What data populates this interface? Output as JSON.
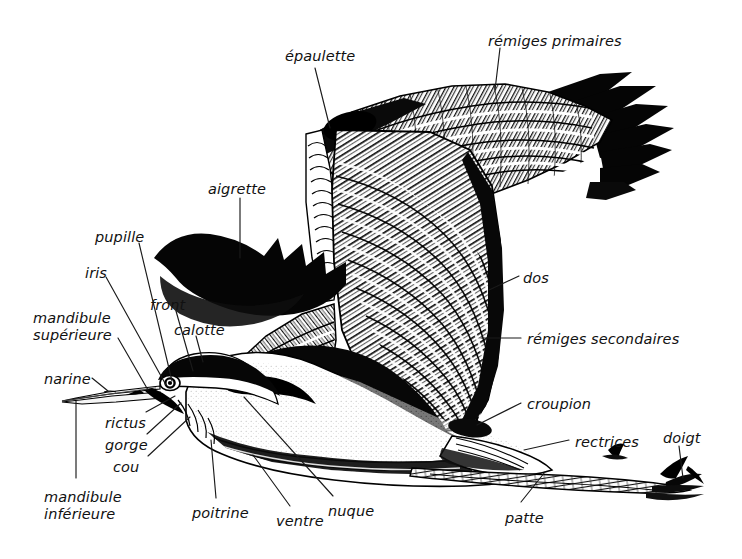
{
  "figure": {
    "style": "black-and-white pen-and-ink engraving",
    "background_color": "#ffffff",
    "ink_color": "#000000",
    "leader_line_color": "#1a1a1a"
  },
  "labels": [
    {
      "id": "epaulette",
      "text": "épaulette",
      "x": 285,
      "y": 48,
      "anchor": "start"
    },
    {
      "id": "remiges-primaires",
      "text": "rémiges primaires",
      "x": 488,
      "y": 33,
      "anchor": "start"
    },
    {
      "id": "aigrette",
      "text": "aigrette",
      "x": 208,
      "y": 181,
      "anchor": "start"
    },
    {
      "id": "pupille",
      "text": "pupille",
      "x": 95,
      "y": 229,
      "anchor": "start"
    },
    {
      "id": "iris",
      "text": "iris",
      "x": 85,
      "y": 265,
      "anchor": "start"
    },
    {
      "id": "mandibule-superieure",
      "text": "mandibule\nsupérieure",
      "x": 33,
      "y": 310,
      "anchor": "start"
    },
    {
      "id": "front",
      "text": "front",
      "x": 150,
      "y": 297,
      "anchor": "start"
    },
    {
      "id": "calotte",
      "text": "calotte",
      "x": 174,
      "y": 322,
      "anchor": "start"
    },
    {
      "id": "narine",
      "text": "narine",
      "x": 44,
      "y": 371,
      "anchor": "start"
    },
    {
      "id": "rictus",
      "text": "rictus",
      "x": 105,
      "y": 415,
      "anchor": "start"
    },
    {
      "id": "gorge",
      "text": "gorge",
      "x": 105,
      "y": 437,
      "anchor": "start"
    },
    {
      "id": "cou",
      "text": "cou",
      "x": 113,
      "y": 459,
      "anchor": "start"
    },
    {
      "id": "mandibule-inferieure",
      "text": "mandibule\ninférieure",
      "x": 44,
      "y": 489,
      "anchor": "start"
    },
    {
      "id": "poitrine",
      "text": "poitrine",
      "x": 192,
      "y": 505,
      "anchor": "start"
    },
    {
      "id": "ventre",
      "text": "ventre",
      "x": 276,
      "y": 513,
      "anchor": "start"
    },
    {
      "id": "nuque",
      "text": "nuque",
      "x": 328,
      "y": 503,
      "anchor": "start"
    },
    {
      "id": "dos",
      "text": "dos",
      "x": 523,
      "y": 270,
      "anchor": "start"
    },
    {
      "id": "remiges-secondaires",
      "text": "rémiges secondaires",
      "x": 527,
      "y": 331,
      "anchor": "start"
    },
    {
      "id": "croupion",
      "text": "croupion",
      "x": 527,
      "y": 396,
      "anchor": "start"
    },
    {
      "id": "rectrices",
      "text": "rectrices",
      "x": 575,
      "y": 434,
      "anchor": "start"
    },
    {
      "id": "patte",
      "text": "patte",
      "x": 505,
      "y": 510,
      "anchor": "start"
    },
    {
      "id": "doigt",
      "text": "doigt",
      "x": 663,
      "y": 430,
      "anchor": "start"
    }
  ],
  "leader_lines": [
    {
      "id": "leader-epaulette",
      "points": "315,68 330,128"
    },
    {
      "id": "leader-remiges-primaires",
      "points": "500,48 495,90"
    },
    {
      "id": "leader-aigrette",
      "points": "240,198 240,258"
    },
    {
      "id": "leader-pupille",
      "points": "139,243 172,381"
    },
    {
      "id": "leader-iris",
      "points": "106,277 166,385"
    },
    {
      "id": "leader-mandibule-superieure",
      "points": "118,338 148,390"
    },
    {
      "id": "leader-front",
      "points": "176,311 193,371"
    },
    {
      "id": "leader-calotte",
      "points": "196,336 203,362"
    },
    {
      "id": "leader-narine",
      "points": "92,378 108,391"
    },
    {
      "id": "leader-rictus",
      "points": "146,412 175,396"
    },
    {
      "id": "leader-gorge",
      "points": "147,434 181,403"
    },
    {
      "id": "leader-cou",
      "points": "148,456 190,417"
    },
    {
      "id": "leader-mandibule-inferieure",
      "points": "76,478 76,401"
    },
    {
      "id": "leader-poitrine",
      "points": "216,498 211,440"
    },
    {
      "id": "leader-ventre",
      "points": "290,506 253,455"
    },
    {
      "id": "leader-nuque",
      "points": "333,496 244,397"
    },
    {
      "id": "leader-dos",
      "points": "519,276 489,290"
    },
    {
      "id": "leader-remiges-secondaires",
      "points": "521,338 481,338"
    },
    {
      "id": "leader-croupion",
      "points": "521,403 477,425"
    },
    {
      "id": "leader-rectrices",
      "points": "569,440 524,450"
    },
    {
      "id": "leader-patte",
      "points": "521,502 545,472"
    },
    {
      "id": "leader-doigt",
      "points": "679,446 683,478"
    }
  ]
}
